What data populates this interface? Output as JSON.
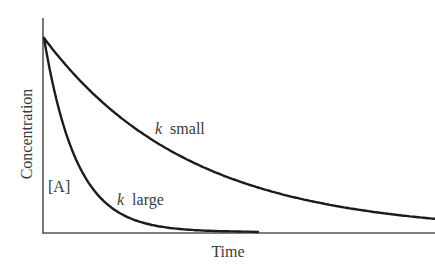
{
  "chart_data": {
    "type": "line",
    "title": "",
    "xlabel": "Time",
    "ylabel": "Concentration",
    "grid": false,
    "legend": "none (inline curve labels)",
    "x": [
      0,
      25,
      50,
      75,
      100,
      150,
      200,
      250,
      300,
      350,
      392
    ],
    "series": [
      {
        "name": "k small",
        "label_k": "k",
        "label_text": "small",
        "values": [
          1.0,
          0.842,
          0.709,
          0.597,
          0.503,
          0.356,
          0.253,
          0.179,
          0.127,
          0.09,
          0.068
        ]
      },
      {
        "name": "k large",
        "label_k": "k",
        "label_text": "large",
        "values": [
          1.0,
          0.464,
          0.215,
          0.1,
          0.046,
          0.01,
          0.002,
          0.0,
          0.0,
          0.0,
          0.0
        ]
      }
    ],
    "annotations": [
      "[A]"
    ],
    "xlim": [
      0,
      392
    ],
    "ylim": [
      0,
      1.0
    ]
  },
  "labels": {
    "ylabel": "Concentration",
    "xlabel": "Time",
    "species": "[A]",
    "k_symbol": "k",
    "small": "small",
    "large": "large"
  },
  "colors": {
    "curve": "#1c1c1c",
    "axis": "#555555",
    "text": "#3a3a3a"
  }
}
